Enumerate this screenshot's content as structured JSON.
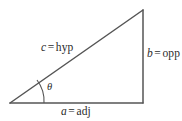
{
  "figure": {
    "type": "right-triangle-trigonometry-diagram",
    "background_color": "#ffffff",
    "stroke_color": "#555555",
    "text_color": "#2b2b2b",
    "vertices": {
      "angle_vertex": [
        10,
        103
      ],
      "apex": [
        143,
        10
      ],
      "right_angle_vertex": [
        143,
        103
      ]
    },
    "sides": {
      "hypotenuse": {
        "variable": "c",
        "relation": "=",
        "name": "hyp",
        "from": [
          10,
          103
        ],
        "to": [
          143,
          10
        ]
      },
      "opposite": {
        "variable": "b",
        "relation": "=",
        "name": "opp",
        "from": [
          143,
          10
        ],
        "to": [
          143,
          103
        ]
      },
      "adjacent": {
        "variable": "a",
        "relation": "=",
        "name": "adj",
        "from": [
          10,
          103
        ],
        "to": [
          143,
          103
        ]
      }
    },
    "angle": {
      "symbol": "θ",
      "arc_from": [
        37,
        80
      ],
      "arc_to": [
        44,
        103
      ]
    }
  }
}
